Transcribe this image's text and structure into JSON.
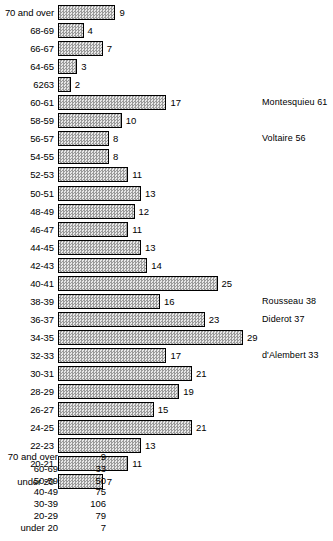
{
  "chart_data": {
    "type": "bar",
    "orientation": "horizontal",
    "title": "",
    "subtitle": "",
    "xlabel": "",
    "ylabel": "",
    "grid": false,
    "legend": "none",
    "xlim": [
      0,
      29
    ],
    "categories": [
      "70 and over",
      "68-69",
      "66-67",
      "64-65",
      "6263",
      "60-61",
      "58-59",
      "56-57",
      "54-55",
      "52-53",
      "50-51",
      "48-49",
      "46-47",
      "44-45",
      "42-43",
      "40-41",
      "38-39",
      "36-37",
      "34-35",
      "32-33",
      "30-31",
      "28-29",
      "26-27",
      "24-25",
      "22-23",
      "20-21",
      "under 20"
    ],
    "values": [
      9,
      4,
      7,
      3,
      2,
      17,
      10,
      8,
      8,
      11,
      13,
      12,
      11,
      13,
      14,
      25,
      16,
      23,
      29,
      17,
      21,
      19,
      15,
      21,
      13,
      11,
      7
    ],
    "annotations": [
      {
        "category": "60-61",
        "text": "Montesquieu 61"
      },
      {
        "category": "56-57",
        "text": "Voltaire 56"
      },
      {
        "category": "38-39",
        "text": "Rousseau 38"
      },
      {
        "category": "36-37",
        "text": "Diderot 37"
      },
      {
        "category": "32-33",
        "text": "d'Alembert 33"
      }
    ],
    "summary_table": {
      "type": "table",
      "columns": [
        "age group",
        "count"
      ],
      "rows": [
        {
          "label": "70 and over",
          "value": "9"
        },
        {
          "label": "60-69",
          "value": "33"
        },
        {
          "label": "50-59",
          "value": "50"
        },
        {
          "label": "40-49",
          "value": "75"
        },
        {
          "label": "30-39",
          "value": "106"
        },
        {
          "label": "20-29",
          "value": "79"
        },
        {
          "label": "under 20",
          "value": "7"
        }
      ]
    },
    "colors": {
      "bar_fill": "#d8d8d8",
      "bar_stroke": "#000000",
      "text": "#000000",
      "background": "#ffffff"
    }
  }
}
